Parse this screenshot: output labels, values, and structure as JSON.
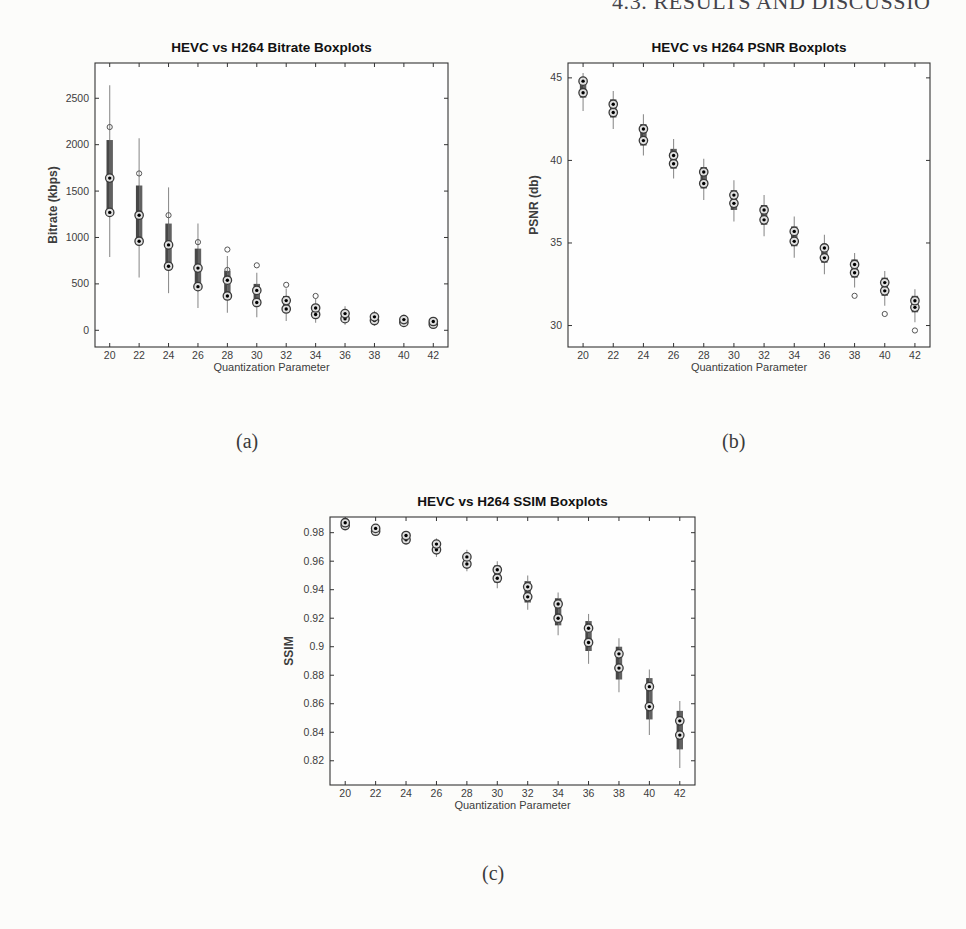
{
  "page": {
    "running_header": "4.3. RESULTS AND DISCUSSIO",
    "captions": {
      "a": "(a)",
      "b": "(b)",
      "c": "(c)"
    }
  },
  "colors": {
    "page_bg": "#fcfcfa",
    "plot_bg": "#fefefe",
    "axis": "#333333",
    "box_fill_dark": "#474747",
    "box_fill_light": "#616161",
    "whisker": "#8f8f8f",
    "median_ring": "#3a3a3a",
    "median_fill": "#e0e0e0",
    "median_dot": "#000000",
    "outlier": "#555555",
    "title_text": "#111111",
    "tick_text": "#3d3d3d",
    "header_text": "#44444a"
  },
  "chart_data": [
    {
      "id": "bitrate",
      "type": "boxplot",
      "title": "HEVC vs H264 Bitrate Boxplots",
      "xlabel": "Quantization Parameter",
      "ylabel": "Bitrate (kbps)",
      "categories": [
        20,
        22,
        24,
        26,
        28,
        30,
        32,
        34,
        36,
        38,
        40,
        42
      ],
      "ytick_values": [
        0,
        500,
        1000,
        1500,
        2000,
        2500
      ],
      "ytick_labels": [
        "0",
        "500",
        "1000",
        "1500",
        "2000",
        "2500"
      ],
      "ylim": [
        -180,
        2880
      ],
      "grid": false,
      "legend": "none",
      "boxes": [
        {
          "qp": 20,
          "whisker": [
            790,
            2640
          ],
          "box": [
            1260,
            2050
          ],
          "medians": [
            1270,
            1640
          ],
          "outliers": [
            2190
          ]
        },
        {
          "qp": 22,
          "whisker": [
            570,
            2070
          ],
          "box": [
            950,
            1560
          ],
          "medians": [
            960,
            1240
          ],
          "outliers": [
            1690
          ]
        },
        {
          "qp": 24,
          "whisker": [
            400,
            1540
          ],
          "box": [
            680,
            1150
          ],
          "medians": [
            690,
            920
          ],
          "outliers": [
            1240
          ]
        },
        {
          "qp": 26,
          "whisker": [
            240,
            1150
          ],
          "box": [
            460,
            880
          ],
          "medians": [
            470,
            670
          ],
          "outliers": [
            950
          ]
        },
        {
          "qp": 28,
          "whisker": [
            190,
            800
          ],
          "box": [
            360,
            640
          ],
          "medians": [
            370,
            540
          ],
          "outliers": [
            870,
            650
          ]
        },
        {
          "qp": 30,
          "whisker": [
            140,
            620
          ],
          "box": [
            290,
            500
          ],
          "medians": [
            300,
            430
          ],
          "outliers": [
            700
          ]
        },
        {
          "qp": 32,
          "whisker": [
            100,
            450
          ],
          "box": [
            220,
            370
          ],
          "medians": [
            230,
            320
          ],
          "outliers": [
            490
          ]
        },
        {
          "qp": 34,
          "whisker": [
            80,
            340
          ],
          "box": [
            160,
            270
          ],
          "medians": [
            170,
            240
          ],
          "outliers": [
            370
          ]
        },
        {
          "qp": 36,
          "whisker": [
            60,
            260
          ],
          "box": [
            120,
            200
          ],
          "medians": [
            125,
            180
          ],
          "outliers": []
        },
        {
          "qp": 38,
          "whisker": [
            50,
            210
          ],
          "box": [
            100,
            160
          ],
          "medians": [
            105,
            145
          ],
          "outliers": []
        },
        {
          "qp": 40,
          "whisker": [
            40,
            170
          ],
          "box": [
            80,
            130
          ],
          "medians": [
            85,
            115
          ],
          "outliers": []
        },
        {
          "qp": 42,
          "whisker": [
            30,
            140
          ],
          "box": [
            60,
            105
          ],
          "medians": [
            65,
            95
          ],
          "outliers": []
        }
      ]
    },
    {
      "id": "psnr",
      "type": "boxplot",
      "title": "HEVC vs H264 PSNR Boxplots",
      "xlabel": "Quantization Parameter",
      "ylabel": "PSNR (db)",
      "categories": [
        20,
        22,
        24,
        26,
        28,
        30,
        32,
        34,
        36,
        38,
        40,
        42
      ],
      "ytick_values": [
        30,
        35,
        40,
        45
      ],
      "ytick_labels": [
        "30",
        "35",
        "40",
        "45"
      ],
      "ylim": [
        28.7,
        45.9
      ],
      "grid": false,
      "legend": "none",
      "boxes": [
        {
          "qp": 20,
          "whisker": [
            43.0,
            45.3
          ],
          "box": [
            43.8,
            45.0
          ],
          "medians": [
            44.1,
            44.8
          ],
          "outliers": []
        },
        {
          "qp": 22,
          "whisker": [
            41.9,
            44.2
          ],
          "box": [
            42.6,
            43.7
          ],
          "medians": [
            42.9,
            43.4
          ],
          "outliers": []
        },
        {
          "qp": 24,
          "whisker": [
            40.3,
            42.8
          ],
          "box": [
            40.9,
            42.2
          ],
          "medians": [
            41.2,
            41.9
          ],
          "outliers": []
        },
        {
          "qp": 26,
          "whisker": [
            38.9,
            41.3
          ],
          "box": [
            39.5,
            40.7
          ],
          "medians": [
            39.8,
            40.3
          ],
          "outliers": []
        },
        {
          "qp": 28,
          "whisker": [
            37.6,
            40.1
          ],
          "box": [
            38.3,
            39.6
          ],
          "medians": [
            38.6,
            39.3
          ],
          "outliers": []
        },
        {
          "qp": 30,
          "whisker": [
            36.3,
            38.8
          ],
          "box": [
            37.0,
            38.2
          ],
          "medians": [
            37.4,
            37.9
          ],
          "outliers": []
        },
        {
          "qp": 32,
          "whisker": [
            35.4,
            37.9
          ],
          "box": [
            36.1,
            37.3
          ],
          "medians": [
            36.4,
            37.0
          ],
          "outliers": []
        },
        {
          "qp": 34,
          "whisker": [
            34.1,
            36.6
          ],
          "box": [
            34.8,
            36.0
          ],
          "medians": [
            35.1,
            35.7
          ],
          "outliers": []
        },
        {
          "qp": 36,
          "whisker": [
            33.1,
            35.5
          ],
          "box": [
            33.8,
            34.9
          ],
          "medians": [
            34.1,
            34.7
          ],
          "outliers": []
        },
        {
          "qp": 38,
          "whisker": [
            32.3,
            34.4
          ],
          "box": [
            32.9,
            34.0
          ],
          "medians": [
            33.2,
            33.7
          ],
          "outliers": [
            31.8
          ]
        },
        {
          "qp": 40,
          "whisker": [
            31.2,
            33.3
          ],
          "box": [
            31.8,
            32.9
          ],
          "medians": [
            32.1,
            32.6
          ],
          "outliers": [
            30.7
          ]
        },
        {
          "qp": 42,
          "whisker": [
            30.2,
            32.2
          ],
          "box": [
            30.8,
            31.8
          ],
          "medians": [
            31.1,
            31.5
          ],
          "outliers": [
            29.7
          ]
        }
      ]
    },
    {
      "id": "ssim",
      "type": "boxplot",
      "title": "HEVC vs H264 SSIM Boxplots",
      "xlabel": "Quantization Parameter",
      "ylabel": "SSIM",
      "categories": [
        20,
        22,
        24,
        26,
        28,
        30,
        32,
        34,
        36,
        38,
        40,
        42
      ],
      "ytick_values": [
        0.82,
        0.84,
        0.86,
        0.88,
        0.9,
        0.92,
        0.94,
        0.96,
        0.98
      ],
      "ytick_labels": [
        "0.82",
        "0.84",
        "0.86",
        "0.88",
        "0.9",
        "0.92",
        "0.94",
        "0.96",
        "0.98"
      ],
      "ylim": [
        0.803,
        0.991
      ],
      "grid": false,
      "legend": "none",
      "boxes": [
        {
          "qp": 20,
          "whisker": [
            0.983,
            0.989
          ],
          "box": [
            0.984,
            0.988
          ],
          "medians": [
            0.985,
            0.987
          ],
          "outliers": []
        },
        {
          "qp": 22,
          "whisker": [
            0.978,
            0.985
          ],
          "box": [
            0.98,
            0.984
          ],
          "medians": [
            0.981,
            0.983
          ],
          "outliers": []
        },
        {
          "qp": 24,
          "whisker": [
            0.972,
            0.981
          ],
          "box": [
            0.974,
            0.979
          ],
          "medians": [
            0.975,
            0.978
          ],
          "outliers": []
        },
        {
          "qp": 26,
          "whisker": [
            0.963,
            0.976
          ],
          "box": [
            0.966,
            0.973
          ],
          "medians": [
            0.968,
            0.972
          ],
          "outliers": []
        },
        {
          "qp": 28,
          "whisker": [
            0.953,
            0.968
          ],
          "box": [
            0.956,
            0.965
          ],
          "medians": [
            0.958,
            0.963
          ],
          "outliers": []
        },
        {
          "qp": 30,
          "whisker": [
            0.941,
            0.96
          ],
          "box": [
            0.945,
            0.957
          ],
          "medians": [
            0.948,
            0.954
          ],
          "outliers": []
        },
        {
          "qp": 32,
          "whisker": [
            0.926,
            0.95
          ],
          "box": [
            0.931,
            0.946
          ],
          "medians": [
            0.935,
            0.942
          ],
          "outliers": []
        },
        {
          "qp": 34,
          "whisker": [
            0.908,
            0.938
          ],
          "box": [
            0.915,
            0.934
          ],
          "medians": [
            0.92,
            0.93
          ],
          "outliers": []
        },
        {
          "qp": 36,
          "whisker": [
            0.888,
            0.923
          ],
          "box": [
            0.897,
            0.918
          ],
          "medians": [
            0.903,
            0.913
          ],
          "outliers": []
        },
        {
          "qp": 38,
          "whisker": [
            0.868,
            0.906
          ],
          "box": [
            0.877,
            0.9
          ],
          "medians": [
            0.885,
            0.895
          ],
          "outliers": []
        },
        {
          "qp": 40,
          "whisker": [
            0.838,
            0.884
          ],
          "box": [
            0.849,
            0.878
          ],
          "medians": [
            0.858,
            0.872
          ],
          "outliers": []
        },
        {
          "qp": 42,
          "whisker": [
            0.815,
            0.862
          ],
          "box": [
            0.828,
            0.855
          ],
          "medians": [
            0.838,
            0.848
          ],
          "outliers": []
        }
      ]
    }
  ]
}
